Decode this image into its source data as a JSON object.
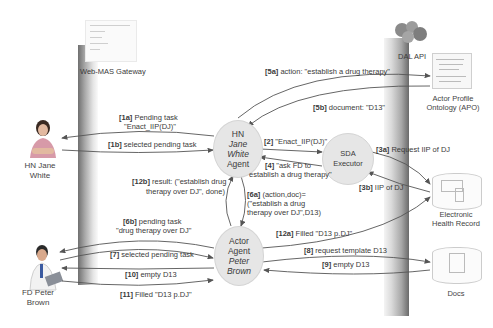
{
  "gateways": {
    "web_mas": "Web-MAS Gateway",
    "dal_api": "DAL API"
  },
  "actors": {
    "hn": {
      "line1": "HN Jane",
      "line2": "White"
    },
    "fd": {
      "line1": "FD Peter",
      "line2": "Brown"
    }
  },
  "nodes": {
    "hn_agent": {
      "l1": "HN",
      "l2": "Jane",
      "l3": "White",
      "l4": "Agent"
    },
    "sda": {
      "l1": "SDA",
      "l2": "Executor"
    },
    "actor_agent": {
      "l1": "Actor",
      "l2": "Agent",
      "l3": "Peter",
      "l4": "Brown"
    }
  },
  "resources": {
    "apo": {
      "line1": "Actor Profile",
      "line2": "Ontology (APO)"
    },
    "ehr": {
      "line1": "Electronic",
      "line2": "Health Record"
    },
    "docs": {
      "line1": "Docs"
    }
  },
  "messages": {
    "m1a": {
      "id": "[1a]",
      "text": "Pending task",
      "text2": "\"Enact_IIP(DJ)\""
    },
    "m1b": {
      "id": "[1b]",
      "text": "selected pending task"
    },
    "m2": {
      "id": "[2]",
      "text": "\"Enact_IIP(DJ)\""
    },
    "m3a": {
      "id": "[3a]",
      "text": "Request IIP of DJ"
    },
    "m3b": {
      "id": "[3b]",
      "text": "IIP of DJ"
    },
    "m4": {
      "id": "[4]",
      "text": "\"ask FD to",
      "text2": "establish a drug therapy\""
    },
    "m5a": {
      "id": "[5a]",
      "text": "action: \"establish a drug therapy\""
    },
    "m5b": {
      "id": "[5b]",
      "text": "document: \"D13\""
    },
    "m6a": {
      "id": "[6a]",
      "text": "(action,doc)=",
      "text2": "(\"establish a drug",
      "text3": "therapy over DJ\",D13)"
    },
    "m6b": {
      "id": "[6b]",
      "text": "pending task",
      "text2": "\"drug therapy over DJ\""
    },
    "m7": {
      "id": "[7]",
      "text": "selected pending task"
    },
    "m8": {
      "id": "[8]",
      "text": "request template D13"
    },
    "m9": {
      "id": "[9]",
      "text": "empty D13"
    },
    "m10": {
      "id": "[10]",
      "text": "empty D13"
    },
    "m11": {
      "id": "[11]",
      "text": "Filled \"D13 p.DJ\""
    },
    "m12a": {
      "id": "[12a]",
      "text": "Filled \"D13 p.DJ\""
    },
    "m12b": {
      "id": "[12b]",
      "text": "result: (\"establish drug",
      "text2": "therapy over DJ\", done)"
    }
  }
}
